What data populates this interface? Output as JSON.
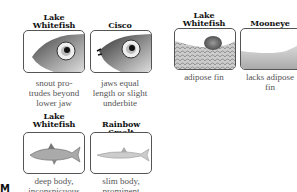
{
  "panels": [
    {
      "id": "lw-head",
      "title_lines": [
        "Lake",
        "Whitefish"
      ],
      "caption_lines": [
        "snout pro-",
        "trudes beyond",
        "lower jaw"
      ],
      "illustration": "whitefish-head-icon"
    },
    {
      "id": "cisco-head",
      "title_lines": [
        "",
        "Cisco"
      ],
      "caption_lines": [
        "jaws equal",
        "length or slight",
        "underbite"
      ],
      "illustration": "cisco-head-icon"
    },
    {
      "id": "lw-fin",
      "title_lines": [
        "Lake",
        "Whitefish"
      ],
      "caption_lines": [
        "adipose fin",
        ""
      ],
      "illustration": "adipose-fin-icon"
    },
    {
      "id": "mooneye-fin",
      "title_lines": [
        "",
        "Mooneye"
      ],
      "caption_lines": [
        "lacks adipose",
        "fin"
      ],
      "illustration": "no-adipose-fin-icon"
    },
    {
      "id": "lw-body",
      "title_lines": [
        "Lake",
        "Whitefish"
      ],
      "caption_lines": [
        "deep body,",
        "inconspicuous"
      ],
      "illustration": "whitefish-body-icon"
    },
    {
      "id": "smelt-body",
      "title_lines": [
        "",
        "Rainbow Smelt"
      ],
      "caption_lines": [
        "slim body,",
        "prominent"
      ],
      "illustration": "smelt-body-icon"
    }
  ],
  "corner_mark": "M"
}
